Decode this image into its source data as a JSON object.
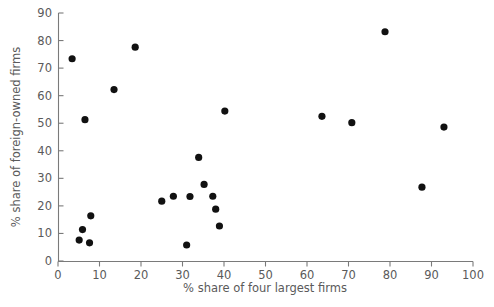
{
  "chart_data": {
    "type": "scatter",
    "title": "",
    "xlabel": "% share of four largest firms",
    "ylabel": "% share of foreign-owned firms",
    "xlim": [
      0,
      100
    ],
    "ylim": [
      0,
      90
    ],
    "xticks": [
      0,
      10,
      20,
      30,
      40,
      50,
      60,
      70,
      80,
      90,
      100
    ],
    "yticks": [
      0,
      10,
      20,
      30,
      40,
      50,
      60,
      70,
      80,
      90
    ],
    "grid": false,
    "legend": null,
    "marker": {
      "shape": "circle",
      "color": "#111111",
      "size": 4.6
    },
    "series": [
      {
        "name": "industries",
        "points": [
          [
            3.4,
            73.4
          ],
          [
            5.1,
            7.6
          ],
          [
            5.9,
            11.4
          ],
          [
            6.5,
            51.3
          ],
          [
            7.6,
            6.6
          ],
          [
            7.9,
            16.4
          ],
          [
            13.5,
            62.2
          ],
          [
            18.6,
            77.6
          ],
          [
            25.0,
            21.7
          ],
          [
            27.8,
            23.5
          ],
          [
            31.0,
            5.8
          ],
          [
            31.8,
            23.4
          ],
          [
            33.9,
            37.6
          ],
          [
            35.2,
            27.8
          ],
          [
            37.3,
            23.5
          ],
          [
            38.0,
            18.8
          ],
          [
            38.9,
            12.7
          ],
          [
            40.2,
            54.4
          ],
          [
            63.6,
            52.5
          ],
          [
            70.8,
            50.2
          ],
          [
            78.8,
            83.2
          ],
          [
            87.7,
            26.8
          ],
          [
            93.0,
            48.6
          ]
        ]
      }
    ]
  },
  "axes": {
    "x_tick_labels": [
      "0",
      "10",
      "20",
      "30",
      "40",
      "50",
      "60",
      "70",
      "80",
      "90",
      "100"
    ],
    "y_tick_labels": [
      "0",
      "10",
      "20",
      "30",
      "40",
      "50",
      "60",
      "70",
      "80",
      "90"
    ],
    "x_axis_title": "% share of four largest firms",
    "y_axis_title": "% share of foreign-owned firms"
  }
}
